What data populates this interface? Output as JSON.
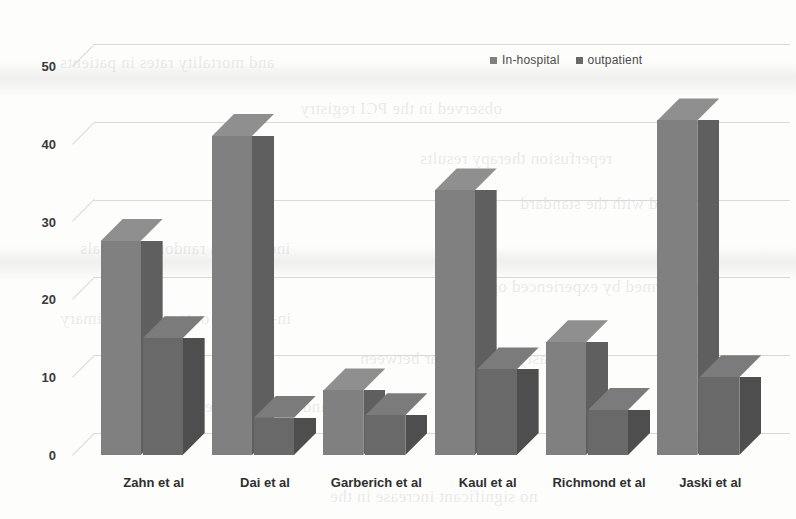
{
  "chart_data": {
    "type": "bar",
    "title": "",
    "subtitle": "",
    "xlabel": "",
    "ylabel": "",
    "categories": [
      "Zahn et al",
      "Dai et al",
      "Garberich et al",
      "Kaul et al",
      "Richmond et al",
      "Jaski et al"
    ],
    "series": [
      {
        "name": "In-hospital",
        "color": "#808080",
        "values": [
          27.5,
          41.0,
          8.3,
          34.0,
          14.5,
          43.0
        ]
      },
      {
        "name": "outpatient",
        "color": "#696969",
        "values": [
          15.0,
          4.8,
          5.1,
          11.0,
          5.8,
          10.0
        ]
      }
    ],
    "ylim": [
      0,
      50
    ],
    "yticks": [
      0,
      10,
      20,
      30,
      40,
      50
    ],
    "ytick_labels": [
      "0",
      "10",
      "20",
      "30",
      "40",
      "50"
    ],
    "grid": true,
    "legend_position": "top-right",
    "style": "3d-clustered-column"
  },
  "legend": {
    "items": [
      {
        "label": "In-hospital",
        "marker": "square-marker"
      },
      {
        "label": "outpatient",
        "marker": "square-marker"
      }
    ]
  },
  "bleed_text": {
    "lines": [
      "and mortality rates in patients",
      "observed in the PCI registry",
      "reperfusion therapy results",
      "compared with the standard",
      "included in randomized trials",
      "performed by experienced operators",
      "in-hospital outcomes of primary",
      "angioplasty were similar between",
      "and transfer for emergency care",
      "no significant increase in the"
    ]
  }
}
